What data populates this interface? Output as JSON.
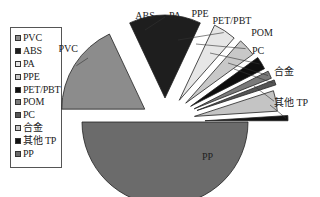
{
  "chart_data": {
    "type": "pie",
    "title": "",
    "exploded": true,
    "legend_position": "left",
    "categories": [
      "PVC",
      "ABS",
      "PA",
      "PPE",
      "PET/PBT",
      "POM",
      "PC",
      "合金",
      "其他 TP",
      "PP"
    ],
    "values": [
      18,
      14,
      4.5,
      3.5,
      2.5,
      1.5,
      1,
      4,
      1,
      50
    ],
    "unit": "%",
    "colors": [
      "#8c8c8c",
      "#1e1e1e",
      "#e6e6e6",
      "#c8c8c8",
      "#0e0e0e",
      "#7a7a7a",
      "#555555",
      "#c4c4c4",
      "#111111",
      "#6b6b6b"
    ]
  },
  "legend": {
    "items": [
      {
        "label": "PVC"
      },
      {
        "label": "ABS"
      },
      {
        "label": "PA"
      },
      {
        "label": "PPE"
      },
      {
        "label": "PET/PBT"
      },
      {
        "label": "POM"
      },
      {
        "label": "PC"
      },
      {
        "label": "合金"
      },
      {
        "label": "其他 TP"
      },
      {
        "label": "PP"
      }
    ]
  }
}
